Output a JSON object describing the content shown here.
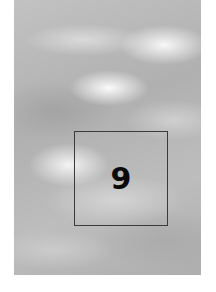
{
  "image": {
    "description": "grayscale cloudy sky texture",
    "overlay_box": {
      "label": "9",
      "border_color": "#3a3a3a"
    },
    "colors": {
      "background": "#ffffff",
      "sky_base": "#b4b4b4",
      "text": "#0a0a0a"
    }
  }
}
